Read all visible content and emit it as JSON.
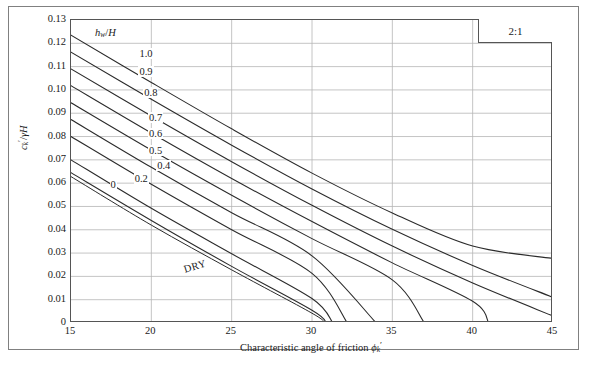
{
  "figure": {
    "ratio_badge": "2:1",
    "legend_title_html": "h_w/H",
    "dry_label": "DRY"
  },
  "chart_data": {
    "type": "line",
    "title": "",
    "xlabel": "Characteristic angle of friction ϕk'",
    "ylabel": "ck'/γH",
    "xlim": [
      15,
      45
    ],
    "ylim": [
      0,
      0.13
    ],
    "xticks": [
      15,
      20,
      25,
      30,
      35,
      40,
      45
    ],
    "xtick_labels": [
      "15",
      "20",
      "25",
      "30",
      "35",
      "40",
      "45"
    ],
    "yticks": [
      0,
      0.01,
      0.02,
      0.03,
      0.04,
      0.05,
      0.06,
      0.07,
      0.08,
      0.09,
      0.1,
      0.11,
      0.12,
      0.13
    ],
    "ytick_labels": [
      "0",
      "0.01",
      "0.02",
      "0.03",
      "0.04",
      "0.05",
      "0.06",
      "0.07",
      "0.08",
      "0.09",
      "0.10",
      "0.11",
      "0.12",
      "0.13"
    ],
    "grid": true,
    "grid_color": "#b5b5b5",
    "line_color": "#2b2b2b",
    "legend_position": "inside-upper-left",
    "legend_title": "hw/H",
    "series": [
      {
        "name": "1.0",
        "label": "1.0",
        "label_x": 19.2,
        "label_y": 0.1155,
        "points": [
          [
            15,
            0.1235
          ],
          [
            20,
            0.1032
          ],
          [
            25,
            0.0833
          ],
          [
            30,
            0.0643
          ],
          [
            35,
            0.0472
          ],
          [
            40,
            0.033
          ],
          [
            45,
            0.0277
          ]
        ]
      },
      {
        "name": "0.9",
        "label": "0.9",
        "label_x": 19.2,
        "label_y": 0.1075,
        "points": [
          [
            15,
            0.1162
          ],
          [
            20,
            0.096
          ],
          [
            25,
            0.0763
          ],
          [
            30,
            0.0575
          ],
          [
            35,
            0.0402
          ],
          [
            40,
            0.0247
          ],
          [
            45,
            0.011
          ]
        ]
      },
      {
        "name": "0.8",
        "label": "0.8",
        "label_x": 19.5,
        "label_y": 0.0985,
        "points": [
          [
            15,
            0.109
          ],
          [
            20,
            0.0888
          ],
          [
            25,
            0.0692
          ],
          [
            30,
            0.0505
          ],
          [
            35,
            0.033
          ],
          [
            40,
            0.0172
          ],
          [
            45,
            0.003
          ]
        ]
      },
      {
        "name": "0.7",
        "label": "0.7",
        "label_x": 19.8,
        "label_y": 0.088,
        "points": [
          [
            15,
            0.1018
          ],
          [
            20,
            0.0815
          ],
          [
            25,
            0.062
          ],
          [
            30,
            0.0435
          ],
          [
            35,
            0.0258
          ],
          [
            40,
            0.0093
          ],
          [
            41.0,
            0.0
          ]
        ]
      },
      {
        "name": "0.6",
        "label": "0.6",
        "label_x": 19.8,
        "label_y": 0.0812,
        "points": [
          [
            15,
            0.0945
          ],
          [
            20,
            0.0742
          ],
          [
            25,
            0.0548
          ],
          [
            30,
            0.0362
          ],
          [
            35,
            0.0185
          ],
          [
            37.0,
            0.0
          ]
        ]
      },
      {
        "name": "0.5",
        "label": "0.5",
        "label_x": 19.8,
        "label_y": 0.074,
        "points": [
          [
            15,
            0.0873
          ],
          [
            20,
            0.0668
          ],
          [
            25,
            0.0473
          ],
          [
            30,
            0.0288
          ],
          [
            34.0,
            0.0
          ]
        ]
      },
      {
        "name": "0.4",
        "label": "0.4",
        "label_x": 20.3,
        "label_y": 0.0672,
        "points": [
          [
            15,
            0.08
          ],
          [
            20,
            0.0595
          ],
          [
            25,
            0.04
          ],
          [
            30,
            0.0213
          ],
          [
            32.2,
            0.0
          ]
        ]
      },
      {
        "name": "0.2",
        "label": "0.2",
        "label_x": 18.9,
        "label_y": 0.0618,
        "points": [
          [
            15,
            0.07
          ],
          [
            20,
            0.0492
          ],
          [
            25,
            0.0297
          ],
          [
            30,
            0.0105
          ],
          [
            31.3,
            0.0
          ]
        ]
      },
      {
        "name": "0",
        "label": "0",
        "label_x": 17.4,
        "label_y": 0.0592,
        "points": [
          [
            15,
            0.0645
          ],
          [
            20,
            0.044
          ],
          [
            25,
            0.0243
          ],
          [
            30,
            0.0055
          ],
          [
            30.9,
            0.0
          ]
        ]
      },
      {
        "name": "DRY",
        "label": "DRY",
        "is_dry": true,
        "points": [
          [
            15,
            0.0628
          ],
          [
            20,
            0.042
          ],
          [
            25,
            0.0228
          ],
          [
            30,
            0.0042
          ],
          [
            30.8,
            0.0
          ]
        ]
      }
    ]
  }
}
